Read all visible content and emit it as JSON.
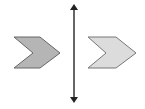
{
  "diagram": {
    "type": "reflection",
    "width": 145,
    "height": 109,
    "line_of_reflection": {
      "x": 74,
      "y_top": 2,
      "y_bottom": 105,
      "color": "#333333",
      "arrowheads": "both"
    },
    "shapes": [
      {
        "name": "original-chevron",
        "fill": "#b5b5b5",
        "stroke": "#666666",
        "points": "14,37 40,37 60,53 40,68 14,68 33,53"
      },
      {
        "name": "image-chevron",
        "fill": "#dcdcdc",
        "stroke": "#777777",
        "points": "88,37 116,37 136,53 116,68 88,68 106,53"
      }
    ]
  }
}
